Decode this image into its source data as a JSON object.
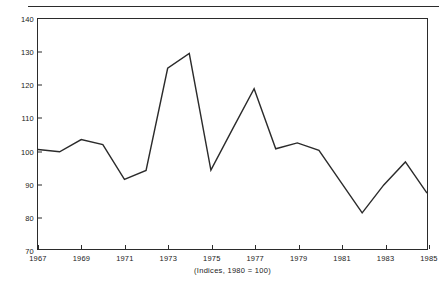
{
  "chart_data": {
    "type": "line",
    "title": "",
    "subtitle": "",
    "caption": "(Indices, 1980 = 100)",
    "xlabel": "",
    "ylabel": "",
    "xlim": [
      1967,
      1985
    ],
    "ylim": [
      70,
      140
    ],
    "grid": false,
    "legend": null,
    "y_ticks": [
      70,
      80,
      90,
      100,
      110,
      120,
      130,
      140
    ],
    "y_tick_labels": [
      "70",
      "80",
      "90",
      "100",
      "110",
      "120",
      "130",
      "140"
    ],
    "x_ticks": [
      1967,
      1969,
      1971,
      1973,
      1975,
      1977,
      1979,
      1981,
      1983,
      1985
    ],
    "x_tick_labels": [
      "1967",
      "1969",
      "1971",
      "1973",
      "1975",
      "1977",
      "1979",
      "1981",
      "1983",
      "1985"
    ],
    "x": [
      1967,
      1968,
      1969,
      1970,
      1971,
      1972,
      1973,
      1974,
      1975,
      1976,
      1977,
      1978,
      1979,
      1980,
      1981,
      1982,
      1983,
      1984,
      1985
    ],
    "values": [
      100.3,
      99.6,
      103.3,
      101.8,
      91.2,
      93.9,
      125.0,
      129.5,
      94.0,
      106.5,
      118.8,
      100.5,
      102.3,
      100.0,
      90.5,
      81.0,
      89.5,
      96.5,
      87.0
    ],
    "series": [
      {
        "name": "index",
        "color": "#2b2b2b",
        "values": [
          100.3,
          99.6,
          103.3,
          101.8,
          91.2,
          93.9,
          125.0,
          129.5,
          94.0,
          106.5,
          118.8,
          100.5,
          102.3,
          100.0,
          90.5,
          81.0,
          89.5,
          96.5,
          87.0
        ]
      }
    ]
  },
  "colors": {
    "line": "#2b2b2b",
    "axis": "#2b2b2b",
    "text": "#1a1a1a",
    "background": "#ffffff"
  }
}
